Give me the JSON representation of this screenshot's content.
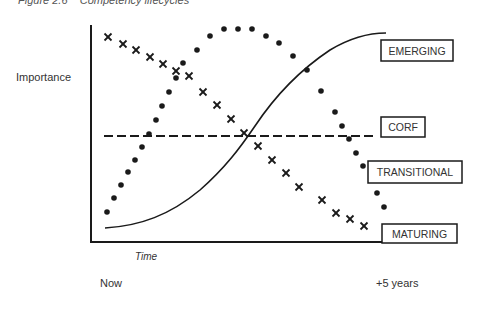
{
  "figure": {
    "caption": "Figure 2.6    Competency lifecycles",
    "y_axis_label": "Importance",
    "x_axis_label": "Time",
    "x_start_label": "Now",
    "x_end_label": "+5 years"
  },
  "chart_data": {
    "type": "line",
    "title": "Competency lifecycles",
    "xlabel": "Time",
    "ylabel": "Importance",
    "x_ticks": [
      "Now",
      "+5 years"
    ],
    "grid": false,
    "legend_position": "right (boxed labels)",
    "series": [
      {
        "name": "EMERGING",
        "style": "solid S-curve",
        "trend": "rises from low to high over time",
        "points": [
          [
            0.0,
            0.07
          ],
          [
            0.2,
            0.2
          ],
          [
            0.35,
            0.38
          ],
          [
            0.48,
            0.51
          ],
          [
            0.62,
            0.72
          ],
          [
            0.78,
            0.91
          ],
          [
            1.0,
            1.0
          ]
        ]
      },
      {
        "name": "CORF",
        "style": "dashed horizontal line",
        "trend": "constant importance over time",
        "points": [
          [
            0.0,
            0.51
          ],
          [
            1.0,
            0.51
          ]
        ]
      },
      {
        "name": "TRANSITIONAL",
        "style": "dots (bell curve)",
        "trend": "rises, peaks mid-period, then falls",
        "points": [
          [
            0.0,
            0.15
          ],
          [
            0.05,
            0.22
          ],
          [
            0.09,
            0.29
          ],
          [
            0.13,
            0.36
          ],
          [
            0.18,
            0.42
          ],
          [
            0.22,
            0.49
          ],
          [
            0.26,
            0.56
          ],
          [
            0.31,
            0.63
          ],
          [
            0.36,
            0.7
          ],
          [
            0.4,
            0.77
          ],
          [
            0.44,
            0.84
          ],
          [
            0.49,
            0.92
          ],
          [
            0.54,
            0.97
          ],
          [
            0.59,
            0.98
          ],
          [
            0.64,
            0.98
          ],
          [
            0.69,
            0.97
          ],
          [
            0.74,
            0.92
          ],
          [
            0.79,
            0.88
          ],
          [
            0.84,
            0.81
          ],
          [
            0.89,
            0.73
          ],
          [
            0.94,
            0.62
          ],
          [
            0.97,
            0.55
          ],
          [
            1.0,
            0.48
          ],
          [
            1.03,
            0.41
          ],
          [
            1.06,
            0.33
          ],
          [
            1.09,
            0.27
          ],
          [
            1.15,
            0.18
          ],
          [
            1.18,
            0.11
          ]
        ]
      },
      {
        "name": "MATURING",
        "style": "x markers (descending)",
        "trend": "declines from high to low over time",
        "points": [
          [
            0.0,
            1.0
          ],
          [
            0.05,
            0.96
          ],
          [
            0.1,
            0.93
          ],
          [
            0.15,
            0.89
          ],
          [
            0.2,
            0.86
          ],
          [
            0.25,
            0.82
          ],
          [
            0.29,
            0.79
          ],
          [
            0.34,
            0.72
          ],
          [
            0.39,
            0.65
          ],
          [
            0.44,
            0.58
          ],
          [
            0.49,
            0.51
          ],
          [
            0.54,
            0.44
          ],
          [
            0.59,
            0.37
          ],
          [
            0.64,
            0.3
          ],
          [
            0.69,
            0.23
          ],
          [
            0.77,
            0.16
          ],
          [
            0.83,
            0.09
          ],
          [
            0.88,
            0.06
          ],
          [
            0.93,
            0.02
          ]
        ]
      }
    ]
  },
  "geometry": {
    "axes": {
      "x0": 91,
      "y_top": 25,
      "y_axis_bottom": 242,
      "x_axis_end": 457
    },
    "emerging_curve": "M105,228 C140,226 170,215 200,190 C225,168 240,148 255,126 C275,96 300,70 330,50 C350,38 368,33 386,33",
    "corf_line": {
      "x1": 104,
      "y1": 136,
      "x2": 375,
      "y2": 136
    },
    "transitional_dots": [
      [
        107,
        212
      ],
      [
        114,
        198
      ],
      [
        121,
        185
      ],
      [
        128,
        172
      ],
      [
        135,
        160
      ],
      [
        142,
        147
      ],
      [
        149,
        134
      ],
      [
        156,
        120
      ],
      [
        162,
        106
      ],
      [
        169,
        92
      ],
      [
        176,
        78
      ],
      [
        183,
        63
      ],
      [
        197,
        50
      ],
      [
        210,
        36
      ],
      [
        224,
        29
      ],
      [
        238,
        29
      ],
      [
        252,
        29
      ],
      [
        266,
        36
      ],
      [
        279,
        43
      ],
      [
        293,
        56
      ],
      [
        307,
        70
      ],
      [
        321,
        91
      ],
      [
        335,
        112
      ],
      [
        342,
        126
      ],
      [
        349,
        139
      ],
      [
        356,
        153
      ],
      [
        363,
        166
      ],
      [
        377,
        193
      ],
      [
        384,
        207
      ]
    ],
    "maturing_marks": [
      [
        108,
        37
      ],
      [
        123,
        44
      ],
      [
        136,
        50
      ],
      [
        150,
        57
      ],
      [
        163,
        64
      ],
      [
        176,
        71
      ],
      [
        189,
        76
      ],
      [
        203,
        92
      ],
      [
        217,
        105
      ],
      [
        231,
        119
      ],
      [
        244,
        133
      ],
      [
        258,
        146
      ],
      [
        272,
        160
      ],
      [
        286,
        173
      ],
      [
        299,
        187
      ],
      [
        322,
        200
      ],
      [
        336,
        213
      ],
      [
        350,
        219
      ],
      [
        364,
        226
      ]
    ]
  },
  "labels": [
    {
      "text": "EMERGING",
      "x": 381,
      "y": 40,
      "w": 72,
      "h": 21
    },
    {
      "text": "CORF",
      "x": 381,
      "y": 117,
      "w": 44,
      "h": 20
    },
    {
      "text": "TRANSITIONAL",
      "x": 368,
      "y": 161,
      "w": 94,
      "h": 22
    },
    {
      "text": "MATURING",
      "x": 382,
      "y": 224,
      "w": 75,
      "h": 19
    }
  ],
  "colors": {
    "ink": "#1a1a1a",
    "text": "#333333",
    "background": "#ffffff"
  }
}
